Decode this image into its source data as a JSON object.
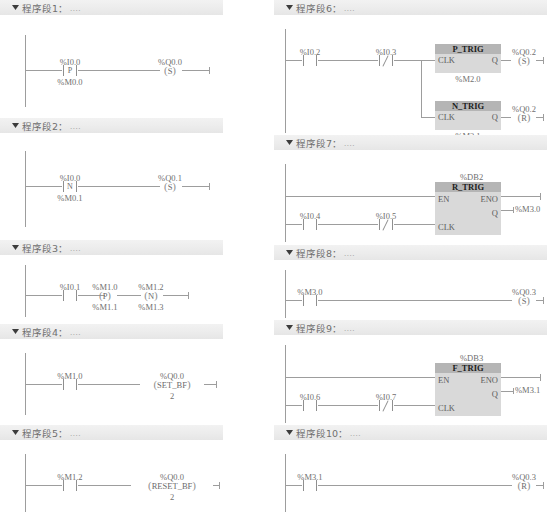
{
  "app": {
    "language": "LAD",
    "network_label_prefix": "程序段",
    "title_separator": "：",
    "title_dots": "....",
    "colors": {
      "header_bg": "#ececec",
      "rail": "#9d9d9d",
      "block_title_bg": "#b5b5b5",
      "block_body_bg": "#d9d9d9",
      "text": "#6f6f6f"
    }
  },
  "networks": [
    {
      "id": 1,
      "title": "程序段1",
      "dots": "....",
      "contacts": [
        {
          "label_top": "%I0.0",
          "symbol": "P",
          "label_bottom": "%M0.0",
          "type": "p-contact"
        }
      ],
      "coils": [
        {
          "label_top": "%Q0.0",
          "symbol": "S",
          "type": "set-coil"
        }
      ]
    },
    {
      "id": 2,
      "title": "程序段2",
      "dots": "....",
      "contacts": [
        {
          "label_top": "%I0.0",
          "symbol": "N",
          "label_bottom": "%M0.1",
          "type": "n-contact"
        }
      ],
      "coils": [
        {
          "label_top": "%Q0.1",
          "symbol": "S",
          "type": "set-coil"
        }
      ]
    },
    {
      "id": 3,
      "title": "程序段3",
      "dots": "....",
      "contacts": [
        {
          "label_top": "%I0.1",
          "symbol": "",
          "label_bottom": "",
          "type": "no-contact"
        }
      ],
      "coils": [
        {
          "label_top": "%M1.0",
          "symbol": "P",
          "label_bottom": "%M1.1",
          "type": "p-coil"
        },
        {
          "label_top": "%M1.2",
          "symbol": "N",
          "label_bottom": "%M1.3",
          "type": "n-coil"
        }
      ]
    },
    {
      "id": 4,
      "title": "程序段4",
      "dots": "....",
      "contacts": [
        {
          "label_top": "%M1.0",
          "symbol": "",
          "label_bottom": "",
          "type": "no-contact"
        }
      ],
      "coils": [
        {
          "label_top": "%Q0.0",
          "symbol": "SET_BF",
          "label_bottom": "2",
          "type": "set-bf-coil"
        }
      ]
    },
    {
      "id": 5,
      "title": "程序段5",
      "dots": "....",
      "contacts": [
        {
          "label_top": "%M1.2",
          "symbol": "",
          "label_bottom": "",
          "type": "no-contact"
        }
      ],
      "coils": [
        {
          "label_top": "%Q0.0",
          "symbol": "RESET_BF",
          "label_bottom": "2",
          "type": "reset-bf-coil"
        }
      ]
    },
    {
      "id": 6,
      "title": "程序段6",
      "dots": "....",
      "contacts": [
        {
          "label_top": "%I0.2",
          "symbol": "",
          "type": "no-contact"
        },
        {
          "label_top": "%I0.3",
          "symbol": "",
          "type": "nc-contact"
        }
      ],
      "blocks": [
        {
          "name": "P_TRIG",
          "instance": "%M2.0",
          "pin_in": "CLK",
          "pin_out": "Q"
        },
        {
          "name": "N_TRIG",
          "instance": "%M2.1",
          "pin_in": "CLK",
          "pin_out": "Q"
        }
      ],
      "coils": [
        {
          "label_top": "%Q0.2",
          "symbol": "S",
          "type": "set-coil"
        },
        {
          "label_top": "%Q0.2",
          "symbol": "R",
          "type": "reset-coil"
        }
      ]
    },
    {
      "id": 7,
      "title": "程序段7",
      "dots": "....",
      "contacts": [
        {
          "label_top": "%I0.4",
          "symbol": "",
          "type": "no-contact"
        },
        {
          "label_top": "%I0.5",
          "symbol": "",
          "type": "nc-contact"
        }
      ],
      "blocks": [
        {
          "name": "R_TRIG",
          "db": "%DB2",
          "pin_en": "EN",
          "pin_eno": "ENO",
          "pin_clk": "CLK",
          "pin_q": "Q",
          "q_target": "%M3.0"
        }
      ]
    },
    {
      "id": 8,
      "title": "程序段8",
      "dots": "....",
      "contacts": [
        {
          "label_top": "%M3.0",
          "symbol": "",
          "type": "no-contact"
        }
      ],
      "coils": [
        {
          "label_top": "%Q0.3",
          "symbol": "S",
          "type": "set-coil"
        }
      ]
    },
    {
      "id": 9,
      "title": "程序段9",
      "dots": "....",
      "contacts": [
        {
          "label_top": "%I0.6",
          "symbol": "",
          "type": "no-contact"
        },
        {
          "label_top": "%I0.7",
          "symbol": "",
          "type": "nc-contact"
        }
      ],
      "blocks": [
        {
          "name": "F_TRIG",
          "db": "%DB3",
          "pin_en": "EN",
          "pin_eno": "ENO",
          "pin_clk": "CLK",
          "pin_q": "Q",
          "q_target": "%M3.1"
        }
      ]
    },
    {
      "id": 10,
      "title": "程序段10",
      "dots": "....",
      "contacts": [
        {
          "label_top": "%M3.1",
          "symbol": "",
          "type": "no-contact"
        }
      ],
      "coils": [
        {
          "label_top": "%Q0.3",
          "symbol": "R",
          "type": "reset-coil"
        }
      ]
    }
  ]
}
